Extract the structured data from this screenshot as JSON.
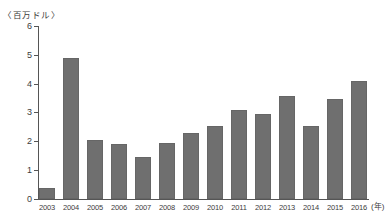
{
  "chart_data": {
    "type": "bar",
    "title": "",
    "unit_label": "〈百万ドル〉",
    "x_axis_suffix": "(年)",
    "categories": [
      "2003",
      "2004",
      "2005",
      "2006",
      "2007",
      "2008",
      "2009",
      "2010",
      "2011",
      "2012",
      "2013",
      "2014",
      "2015",
      "2016"
    ],
    "values": [
      0.4,
      4.9,
      2.05,
      1.9,
      1.45,
      1.95,
      2.3,
      2.55,
      3.1,
      2.95,
      3.6,
      2.55,
      3.5,
      4.1
    ],
    "xlabel": "年",
    "ylabel": "百万ドル",
    "ylim": [
      0,
      6
    ],
    "yticks": [
      0,
      1,
      2,
      3,
      4,
      5,
      6
    ],
    "grid": false,
    "legend": "none",
    "bar_color": "#6f6f6f",
    "axis_color": "#555555",
    "text_color": "#3c3c3c"
  }
}
